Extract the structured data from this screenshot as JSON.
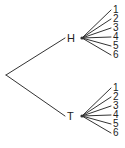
{
  "diagram": {
    "type": "probability-tree",
    "root": {
      "x": 6,
      "y": 75
    },
    "line_color": "#333333",
    "branches": [
      {
        "label": "H",
        "label_pos": {
          "x": 67,
          "y": 33
        },
        "node": {
          "x": 82,
          "y": 38
        },
        "outcomes": [
          {
            "label": "1",
            "y": 10
          },
          {
            "label": "2",
            "y": 19
          },
          {
            "label": "3",
            "y": 28
          },
          {
            "label": "4",
            "y": 37
          },
          {
            "label": "5",
            "y": 46
          },
          {
            "label": "6",
            "y": 55
          }
        ]
      },
      {
        "label": "T",
        "label_pos": {
          "x": 67,
          "y": 111
        },
        "node": {
          "x": 82,
          "y": 116
        },
        "outcomes": [
          {
            "label": "1",
            "y": 88
          },
          {
            "label": "2",
            "y": 97
          },
          {
            "label": "3",
            "y": 106
          },
          {
            "label": "4",
            "y": 115
          },
          {
            "label": "5",
            "y": 124
          },
          {
            "label": "6",
            "y": 133
          }
        ]
      }
    ],
    "leaf_line_end_x": 111,
    "leaf_label_x": 113
  }
}
